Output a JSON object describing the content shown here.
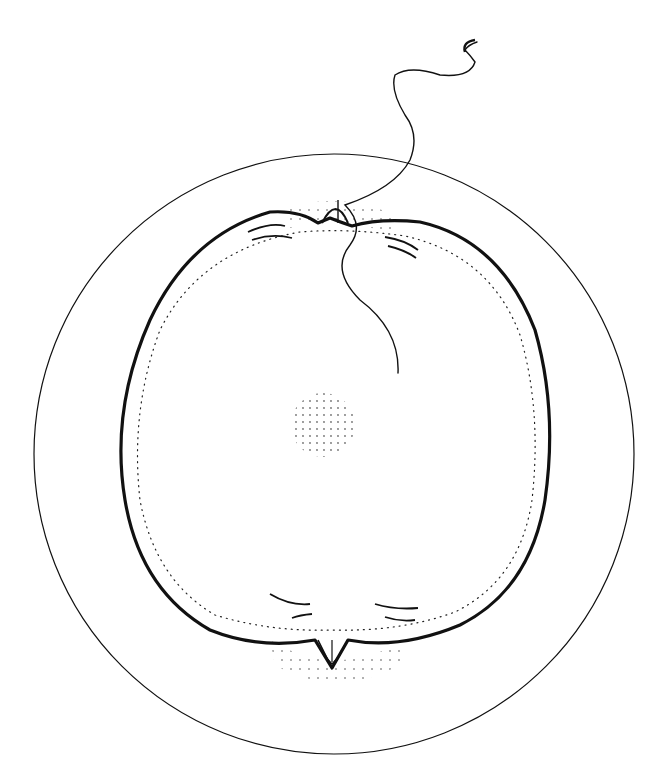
{
  "figure": {
    "type": "line-drawing",
    "colors": {
      "ink": "#111111",
      "background": "#ffffff"
    },
    "parts": [
      {
        "name": "outer-membrane",
        "label": ""
      },
      {
        "name": "cell-body",
        "label": ""
      },
      {
        "name": "nucleus",
        "label": ""
      },
      {
        "name": "sperm",
        "label": ""
      },
      {
        "name": "top-cone",
        "label": ""
      },
      {
        "name": "bottom-cone",
        "label": ""
      }
    ]
  }
}
